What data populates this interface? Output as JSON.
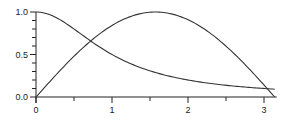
{
  "chart_data": {
    "type": "line",
    "title": "",
    "xlabel": "",
    "ylabel": "",
    "xlim": [
      0,
      3.14159
    ],
    "ylim": [
      0,
      1
    ],
    "grid": false,
    "legend": null,
    "x_ticks": [
      "0",
      "1",
      "2",
      "3"
    ],
    "x_minor_ticks": [
      0.5,
      1.5,
      2.5
    ],
    "y_ticks": [
      "0.0",
      "0.5",
      "1.0"
    ],
    "y_minor_step": 0.1,
    "series": [
      {
        "name": "sin(x)",
        "x": [
          0,
          0.25,
          0.5,
          0.75,
          1.0,
          1.25,
          1.5,
          1.5708,
          1.75,
          2.0,
          2.25,
          2.5,
          2.75,
          3.0,
          3.14159
        ],
        "y": [
          0,
          0.247,
          0.479,
          0.682,
          0.841,
          0.949,
          0.997,
          1.0,
          0.984,
          0.909,
          0.778,
          0.598,
          0.382,
          0.141,
          0
        ]
      },
      {
        "name": "1/(1+x^2)",
        "x": [
          0,
          0.25,
          0.5,
          0.75,
          1.0,
          1.25,
          1.5,
          1.75,
          2.0,
          2.25,
          2.5,
          2.75,
          3.0,
          3.14159
        ],
        "y": [
          1.0,
          0.941,
          0.8,
          0.64,
          0.5,
          0.39,
          0.308,
          0.246,
          0.2,
          0.165,
          0.138,
          0.117,
          0.1,
          0.092
        ]
      }
    ]
  }
}
